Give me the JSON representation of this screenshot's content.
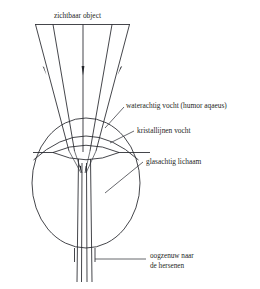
{
  "diagram": {
    "language": "nl",
    "background_color": "#ffffff",
    "ink_color": "#23252b",
    "labels": {
      "object": "zichtbaar object",
      "aqueous": "waterachtig vocht (humor aqaeus)",
      "lens": "kristallijnen vocht",
      "vitreous": "glasachtig lichaam",
      "nerve_line1": "oogzenuw naar",
      "nerve_line2": "de hersenen"
    },
    "geometry": {
      "object_bar": {
        "x1": 35,
        "x2": 130,
        "y": 24
      },
      "eyeball": {
        "cx": 86,
        "cy": 183,
        "rx": 54,
        "ry": 65
      },
      "lens": {
        "cx": 86,
        "cy": 152,
        "half_width": 33,
        "half_height": 11
      },
      "rays": [
        {
          "top_x": 36,
          "top_y": 25,
          "arrow_x": 44,
          "arrow_y": 70
        },
        {
          "top_x": 83,
          "top_y": 25,
          "arrow_x": 83,
          "arrow_y": 70
        },
        {
          "top_x": 129,
          "top_y": 25,
          "arrow_x": 119,
          "arrow_y": 70
        }
      ],
      "optic_nerve": {
        "x_left": 78,
        "x_right": 94,
        "y_top": 158,
        "y_bottom": 282
      }
    }
  }
}
